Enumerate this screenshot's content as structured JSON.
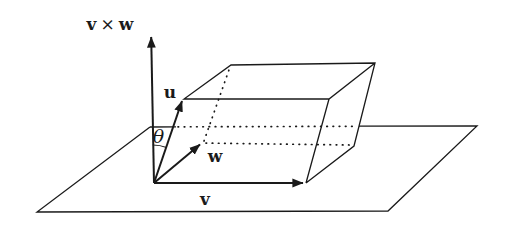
{
  "figure": {
    "background": "#ffffff",
    "ink_color": "#1a1a1a",
    "labels": {
      "cross_v": "v",
      "cross_times": "×",
      "cross_w": "w",
      "u": "u",
      "w": "w",
      "v": "v",
      "theta": "θ"
    }
  }
}
